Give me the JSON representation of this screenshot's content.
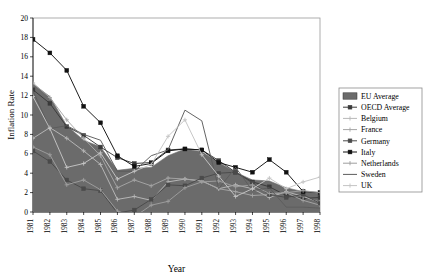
{
  "chart_data": {
    "type": "line",
    "title": "",
    "xlabel": "Year",
    "ylabel": "Inflation Rate",
    "xlim": [
      1981,
      1998
    ],
    "ylim": [
      0,
      20
    ],
    "ytick_step": 2,
    "grid": false,
    "legend_position": "right",
    "categories": [
      1981,
      1982,
      1983,
      1984,
      1985,
      1986,
      1987,
      1988,
      1989,
      1990,
      1991,
      1992,
      1993,
      1994,
      1995,
      1996,
      1997,
      1998
    ],
    "xtick_labels": [
      "1981",
      "1982",
      "1983",
      "1984",
      "1985",
      "1986",
      "1987",
      "1988",
      "1989",
      "1990",
      "1991",
      "1992",
      "1993",
      "1994",
      "1995",
      "1996",
      "1997",
      "1998"
    ],
    "ytick_labels": [
      "0",
      "2",
      "4",
      "6",
      "8",
      "10",
      "12",
      "14",
      "16",
      "18",
      "20"
    ],
    "area_series": {
      "name": "EU Average",
      "type": "area",
      "color": "#6b6b6b",
      "values": [
        13.2,
        11.9,
        8.9,
        7.4,
        6.7,
        4.3,
        4.5,
        4.6,
        5.8,
        6.5,
        6.2,
        5.1,
        4.1,
        3.3,
        3.2,
        2.5,
        2.1,
        1.9
      ]
    },
    "series": [
      {
        "name": "OECD Average",
        "color": "#3a3a3a",
        "marker": "square-filled",
        "values": [
          12.6,
          11.2,
          8.8,
          7.9,
          6.7,
          5.6,
          5.0,
          5.1,
          6.4,
          6.5,
          6.4,
          5.3,
          4.1,
          3.1,
          2.6,
          1.7,
          1.4,
          1.5
        ]
      },
      {
        "name": "Belgium",
        "color": "#b8b8b8",
        "marker": "cross",
        "values": [
          7.6,
          8.7,
          7.6,
          6.3,
          4.9,
          1.3,
          1.6,
          1.2,
          3.1,
          3.4,
          3.2,
          2.4,
          2.8,
          2.4,
          1.5,
          2.1,
          1.6,
          1.0
        ]
      },
      {
        "name": "France",
        "color": "#a5a5a5",
        "marker": "cross",
        "values": [
          13.3,
          11.8,
          9.5,
          7.6,
          5.8,
          2.5,
          3.3,
          2.7,
          3.5,
          3.4,
          3.2,
          2.4,
          2.1,
          1.7,
          1.8,
          2.0,
          1.2,
          0.7
        ]
      },
      {
        "name": "Germany",
        "color": "#4a4a4a",
        "marker": "square-filled",
        "values": [
          6.3,
          5.2,
          3.3,
          2.4,
          2.2,
          -0.1,
          0.2,
          1.3,
          2.8,
          2.7,
          3.5,
          4.0,
          4.1,
          3.0,
          1.8,
          1.5,
          1.8,
          0.9
        ]
      },
      {
        "name": "Italy",
        "color": "#111111",
        "marker": "square-filled",
        "values": [
          17.8,
          16.4,
          14.6,
          10.9,
          9.2,
          5.8,
          4.7,
          5.0,
          6.3,
          6.5,
          6.4,
          5.1,
          4.6,
          4.1,
          5.4,
          4.1,
          2.1,
          2.0
        ]
      },
      {
        "name": "Netherlands",
        "color": "#9e9e9e",
        "marker": "cross",
        "values": [
          6.7,
          5.9,
          2.8,
          3.3,
          2.3,
          0.1,
          -0.5,
          0.7,
          1.1,
          2.5,
          3.1,
          3.2,
          2.6,
          2.8,
          1.9,
          2.0,
          2.2,
          2.0
        ]
      },
      {
        "name": "Sweden",
        "color": "#5c5c5c",
        "marker": "line",
        "values": [
          12.5,
          8.6,
          8.9,
          8.0,
          7.4,
          4.2,
          4.2,
          5.8,
          6.4,
          10.5,
          9.4,
          2.4,
          4.6,
          2.2,
          2.5,
          0.5,
          0.5,
          0.4
        ]
      },
      {
        "name": "UK",
        "color": "#c4c4c4",
        "marker": "cross",
        "values": [
          11.9,
          8.6,
          4.6,
          5.0,
          6.1,
          3.4,
          4.2,
          4.9,
          7.8,
          9.5,
          5.9,
          3.7,
          1.6,
          2.4,
          3.5,
          2.4,
          3.1,
          3.6
        ]
      }
    ]
  },
  "legend": {
    "items": [
      {
        "label": "EU Average",
        "swatch": "area"
      },
      {
        "label": "OECD Average",
        "swatch": "line-marker"
      },
      {
        "label": "Belgium",
        "swatch": "line-cross"
      },
      {
        "label": "France",
        "swatch": "line-cross"
      },
      {
        "label": "Germany",
        "swatch": "line-marker"
      },
      {
        "label": "Italy",
        "swatch": "line-marker"
      },
      {
        "label": "Netherlands",
        "swatch": "line-cross"
      },
      {
        "label": "Sweden",
        "swatch": "line-plain"
      },
      {
        "label": "UK",
        "swatch": "line-cross"
      }
    ]
  }
}
